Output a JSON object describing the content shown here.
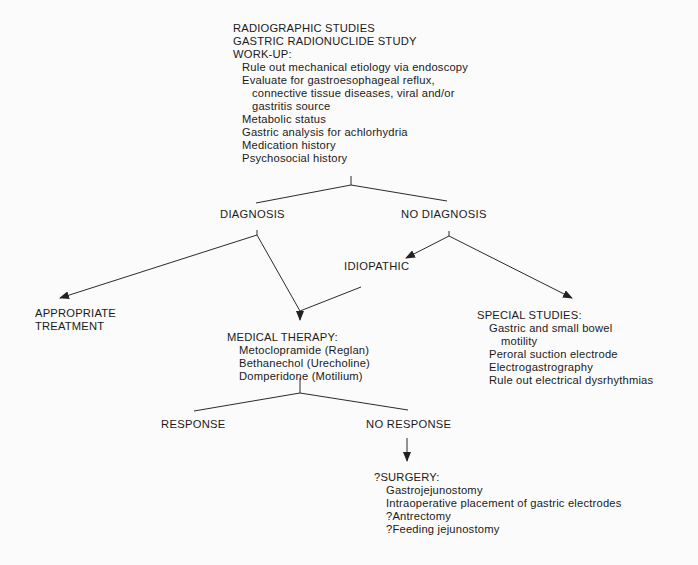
{
  "workup": {
    "titles": [
      "RADIOGRAPHIC STUDIES",
      "GASTRIC RADIONUCLIDE STUDY",
      "WORK-UP:"
    ],
    "items": [
      {
        "text": "Rule out mechanical etiology via endoscopy",
        "indent": 1
      },
      {
        "text": "Evaluate for gastroesophageal reflux,",
        "indent": 1
      },
      {
        "text": "connective tissue diseases, viral and/or",
        "indent": 2
      },
      {
        "text": "gastritis source",
        "indent": 2
      },
      {
        "text": "Metabolic status",
        "indent": 1
      },
      {
        "text": "Gastric analysis for achlorhydria",
        "indent": 1
      },
      {
        "text": "Medication history",
        "indent": 1
      },
      {
        "text": "Psychosocial history",
        "indent": 1
      }
    ]
  },
  "diagnosis": "DIAGNOSIS",
  "no_diagnosis": "NO DIAGNOSIS",
  "idiopathic": "IDIOPATHIC",
  "appropriate_treatment": [
    "APPROPRIATE",
    "TREATMENT"
  ],
  "medical_therapy": {
    "title": "MEDICAL THERAPY:",
    "items": [
      "Metoclopramide (Reglan)",
      "Bethanechol (Urecholine)",
      "Domperidone (Motilium)"
    ]
  },
  "special_studies": {
    "title": "SPECIAL STUDIES:",
    "items": [
      {
        "text": "Gastric and small bowel",
        "indent": 1
      },
      {
        "text": "motility",
        "indent": 2
      },
      {
        "text": "Peroral suction electrode",
        "indent": 1
      },
      {
        "text": "Electrogastrography",
        "indent": 1
      },
      {
        "text": "Rule out electrical dysrhythmias",
        "indent": 1
      }
    ]
  },
  "response": "RESPONSE",
  "no_response": "NO RESPONSE",
  "surgery": {
    "title": "?SURGERY:",
    "items": [
      "Gastrojejunostomy",
      "Intraoperative placement of gastric electrodes",
      "?Antrectomy",
      "?Feeding jejunostomy"
    ]
  },
  "colors": {
    "line": "#2a2a2a",
    "text": "#1a1a1a",
    "background": "#fbfbfb"
  }
}
